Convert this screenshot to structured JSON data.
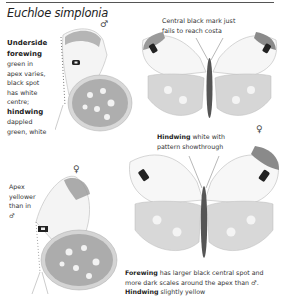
{
  "page": {
    "species_title": "Euchloe simplonia"
  },
  "captions": {
    "underside": {
      "bold1": "Underside",
      "bold2": "forewing",
      "text1": "green in",
      "text2": "apex varies,",
      "text3": "black spot",
      "text4": "has white",
      "text5": "centre;",
      "bold3": "hindwing",
      "text6": "dappled",
      "text7": "green, white"
    },
    "central_mark": {
      "line1": "Central black mark just",
      "line2": "fails to reach costa"
    },
    "hindwing_white": {
      "bold": "Hindwing",
      "line1_rest": " white with",
      "line2": "pattern showthrough"
    },
    "apex": {
      "line1": "Apex",
      "line2": "yellower",
      "line3": "than in",
      "symbol": "♂"
    },
    "female_forewing": {
      "bold1": "Forewing",
      "line1_rest": " has larger black central spot and",
      "line2": "more dark scales around the apex than ♂.",
      "bold2": "Hindwing",
      "line3_rest": " slightly yellow"
    }
  },
  "sex_symbols": {
    "male_underside": "♂",
    "male_upperside": "♂",
    "female_upperside": "♀",
    "female_underside": "♀"
  },
  "colors": {
    "text": "#222222",
    "rule": "#555555",
    "wing_pattern": "#8a8a8a",
    "wing_dark": "#2a2a2a"
  }
}
